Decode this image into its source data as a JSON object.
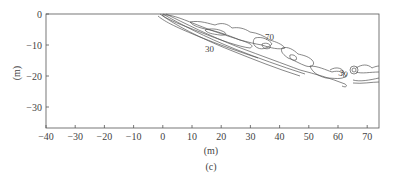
{
  "chart_data": {
    "type": "contour",
    "title": "",
    "caption": "(c)",
    "xlabel": "(m)",
    "ylabel": "(m)",
    "xlim": [
      -40,
      74
    ],
    "ylim": [
      -37,
      0
    ],
    "xticks": [
      -40,
      -30,
      -20,
      -10,
      0,
      10,
      20,
      30,
      40,
      50,
      60,
      70
    ],
    "yticks": [
      0,
      -10,
      -20,
      -30
    ],
    "xtick_labels": [
      "-40",
      "-30",
      "-20",
      "-10",
      "0",
      "10",
      "20",
      "30",
      "40",
      "50",
      "60",
      "70"
    ],
    "ytick_labels": [
      "0",
      "-10",
      "-20",
      "-30"
    ],
    "grid": false,
    "contour_labels": [
      {
        "text": "30",
        "x": 12,
        "y": -13
      },
      {
        "text": "70",
        "x": 34,
        "y": -10
      },
      {
        "text": "30",
        "x": 57,
        "y": -17
      }
    ]
  },
  "figure": {
    "panel_label": "(c)",
    "x_axis_title": "(m)",
    "y_axis_title": "(m)"
  }
}
